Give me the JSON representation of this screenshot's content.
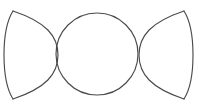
{
  "canvas": {
    "width": 197,
    "height": 107,
    "background_color": "#ffffff"
  },
  "artwork": {
    "name": "Triple Goddess symbol",
    "description": "Waxing crescent, full moon circle, and waning crescent outlined in dark gray on a white background",
    "stroke_color": "#4a4a4a",
    "stroke_width": 1.15,
    "fill": "none"
  },
  "shapes": {
    "left_crescent": {
      "label": "waxing crescent moon",
      "top_tip": [
        13,
        11
      ],
      "bottom_tip": [
        13,
        99
      ],
      "outer_arc_path": "M 13 11 C 1 30 1 80 13 99",
      "inner_arc_path": "M 13 11 C 46 22 58 36 58 55 C 58 74 46 88 13 99",
      "outer_extent_x": 2,
      "inner_crossing_x": 58
    },
    "center_circle": {
      "label": "full moon circle",
      "center": [
        97,
        54
      ],
      "radius": 41
    },
    "right_crescent": {
      "label": "waning crescent moon",
      "top_tip": [
        184,
        11
      ],
      "bottom_tip": [
        184,
        99
      ],
      "outer_arc_path": "M 184 11 C 196 30 196 80 184 99",
      "inner_arc_path": "M 184 11 C 151 22 139 36 139 55 C 139 74 151 88 184 99",
      "outer_extent_x": 195,
      "inner_crossing_x": 139
    }
  }
}
